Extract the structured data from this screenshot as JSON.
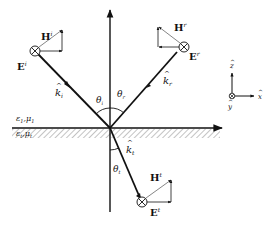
{
  "diagram": {
    "colors": {
      "line": "#111111",
      "hatch": "#888888",
      "background": "#ffffff"
    },
    "media": {
      "upper": {
        "eps": "ε",
        "eps_sub": "1",
        "mu": "μ",
        "mu_sub": "1",
        "sep": ","
      },
      "lower": {
        "eps": "ε",
        "eps_sub": "t",
        "mu": "μ",
        "mu_sub": "t",
        "sep": ","
      }
    },
    "incident": {
      "E": "E",
      "E_sup": "i",
      "H": "H",
      "H_sup": "i",
      "k": "k",
      "k_hat": "^",
      "k_sub": "i",
      "theta": "θ",
      "theta_sub": "i"
    },
    "reflected": {
      "E": "E",
      "E_sup": "r",
      "H": "H",
      "H_sup": "r",
      "k": "k",
      "k_hat": "^",
      "k_sub": "r",
      "theta": "θ",
      "theta_sub": "r"
    },
    "transmitted": {
      "E": "E",
      "E_sup": "t",
      "H": "H",
      "H_sup": "t",
      "k": "k",
      "k_hat": "^",
      "k_sub": "t",
      "theta": "θ",
      "theta_sub": "t"
    },
    "axes": {
      "z": "z",
      "x": "x",
      "y": "y",
      "hat": "^"
    }
  }
}
